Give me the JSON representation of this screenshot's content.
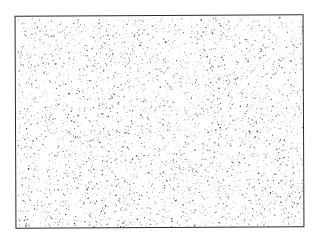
{
  "image": {
    "description": "Rectangular frame filled with random stipple dots (noise pattern)",
    "background_color": "#ffffff",
    "frame": {
      "x": 15,
      "y": 15,
      "width": 289,
      "height": 213,
      "stroke": "#2a2a2a"
    },
    "stipple": {
      "dot_count": 3800,
      "dot_color": "#333333",
      "min_radius": 0.35,
      "max_radius": 0.9,
      "seed": 7
    }
  }
}
